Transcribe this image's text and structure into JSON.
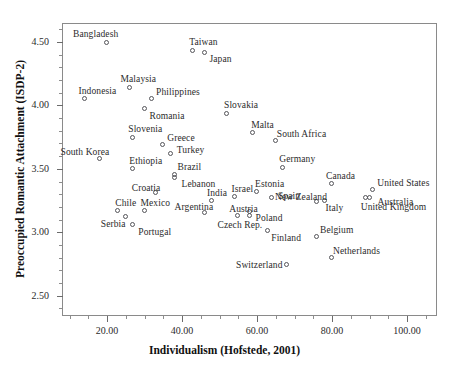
{
  "chart_data": {
    "type": "scatter",
    "title": "",
    "xlabel": "Individualism (Hofstede, 2001)",
    "ylabel": "Preoccupied Romantic Attachment (ISDP-2)",
    "xlim": [
      8,
      108
    ],
    "ylim": [
      2.34,
      4.65
    ],
    "grid": false,
    "legend": "none",
    "xticks": [
      "20.00",
      "40.00",
      "60.00",
      "80.00",
      "100.00"
    ],
    "xtick_values": [
      20,
      40,
      60,
      80,
      100
    ],
    "yticks": [
      "4.50",
      "4.00",
      "3.50",
      "3.00",
      "2.50"
    ],
    "ytick_values": [
      4.5,
      4.0,
      3.5,
      3.0,
      2.5
    ],
    "xminor_step": 5,
    "yminor_step": 0.1,
    "points": [
      {
        "label": "Bangladesh",
        "x": 20,
        "y": 4.49,
        "lx": -34,
        "ly": -13
      },
      {
        "label": "Taiwan",
        "x": 43,
        "y": 4.43,
        "lx": -4,
        "ly": -13
      },
      {
        "label": "Japan",
        "x": 46,
        "y": 4.41,
        "lx": 5,
        "ly": 2
      },
      {
        "label": "Malaysia",
        "x": 26,
        "y": 4.14,
        "lx": -9,
        "ly": -13
      },
      {
        "label": "Philippines",
        "x": 32,
        "y": 4.05,
        "lx": 4,
        "ly": -11
      },
      {
        "label": "Indonesia",
        "x": 14,
        "y": 4.05,
        "lx": -6,
        "ly": -12
      },
      {
        "label": "Romania",
        "x": 30,
        "y": 3.97,
        "lx": 5,
        "ly": 3
      },
      {
        "label": "Slovakia",
        "x": 52,
        "y": 3.93,
        "lx": -3,
        "ly": -13
      },
      {
        "label": "Malta",
        "x": 59,
        "y": 3.78,
        "lx": -2,
        "ly": -12
      },
      {
        "label": "South Africa",
        "x": 65,
        "y": 3.72,
        "lx": 1,
        "ly": -11
      },
      {
        "label": "Slovenia",
        "x": 27,
        "y": 3.74,
        "lx": -5,
        "ly": -13
      },
      {
        "label": "Greece",
        "x": 35,
        "y": 3.69,
        "lx": 4,
        "ly": -11
      },
      {
        "label": "Turkey",
        "x": 37,
        "y": 3.62,
        "lx": 6,
        "ly": -8
      },
      {
        "label": "South Korea",
        "x": 18,
        "y": 3.58,
        "lx": -39,
        "ly": -11
      },
      {
        "label": "Ethiopia",
        "x": 27,
        "y": 3.5,
        "lx": -4,
        "ly": -12
      },
      {
        "label": "Germany",
        "x": 67,
        "y": 3.51,
        "lx": -4,
        "ly": -13
      },
      {
        "label": "Brazil",
        "x": 38,
        "y": 3.45,
        "lx": 3,
        "ly": -12
      },
      {
        "label": "Lebanon",
        "x": 38,
        "y": 3.43,
        "lx": 7,
        "ly": 2
      },
      {
        "label": "Croatia",
        "x": 33,
        "y": 3.31,
        "lx": -24,
        "ly": -9
      },
      {
        "label": "Canada",
        "x": 80,
        "y": 3.38,
        "lx": -6,
        "ly": -12
      },
      {
        "label": "United States",
        "x": 91,
        "y": 3.33,
        "lx": 4,
        "ly": -11
      },
      {
        "label": "India",
        "x": 48,
        "y": 3.25,
        "lx": -5,
        "ly": -12
      },
      {
        "label": "Israel",
        "x": 54,
        "y": 3.28,
        "lx": -3,
        "ly": -12
      },
      {
        "label": "Estonia",
        "x": 60,
        "y": 3.32,
        "lx": -2,
        "ly": -12
      },
      {
        "label": "Spain",
        "x": 64,
        "y": 3.27,
        "lx": 6,
        "ly": -6
      },
      {
        "label": "New Zealand",
        "x": 76,
        "y": 3.24,
        "lx": -42,
        "ly": -9
      },
      {
        "label": "Italy",
        "x": 78,
        "y": 3.25,
        "lx": 1,
        "ly": 3
      },
      {
        "label": "Australia",
        "x": 90,
        "y": 3.27,
        "lx": 8,
        "ly": 0
      },
      {
        "label": "United Kingdom",
        "x": 89,
        "y": 3.27,
        "lx": -5,
        "ly": 5
      },
      {
        "label": "Chile",
        "x": 23,
        "y": 3.17,
        "lx": -3,
        "ly": -12
      },
      {
        "label": "Mexico",
        "x": 30,
        "y": 3.17,
        "lx": -4,
        "ly": -12
      },
      {
        "label": "Argentina",
        "x": 46,
        "y": 3.15,
        "lx": -30,
        "ly": -10
      },
      {
        "label": "Austria",
        "x": 55,
        "y": 3.13,
        "lx": -9,
        "ly": -11
      },
      {
        "label": "Poland",
        "x": 58,
        "y": 3.16,
        "lx": 6,
        "ly": 2
      },
      {
        "label": "Serbia",
        "x": 25,
        "y": 3.12,
        "lx": -25,
        "ly": 3
      },
      {
        "label": "Portugal",
        "x": 27,
        "y": 3.06,
        "lx": 5,
        "ly": 3
      },
      {
        "label": "Czech Rep.",
        "x": 58,
        "y": 3.13,
        "lx": -32,
        "ly": 5
      },
      {
        "label": "Finland",
        "x": 63,
        "y": 3.01,
        "lx": 3,
        "ly": 3
      },
      {
        "label": "Belgium",
        "x": 76,
        "y": 2.96,
        "lx": 3,
        "ly": -11
      },
      {
        "label": "Netherlands",
        "x": 80,
        "y": 2.8,
        "lx": 1,
        "ly": -11
      },
      {
        "label": "Switzerland",
        "x": 68,
        "y": 2.74,
        "lx": -51,
        "ly": -4
      }
    ]
  }
}
